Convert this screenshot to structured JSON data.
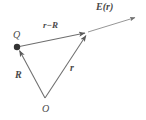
{
  "figure": {
    "width": 146,
    "height": 120,
    "background_color": "#ffffff",
    "stroke_color": "#6e6e6e",
    "text_color": "#4a4a4a"
  },
  "labels": {
    "field": "E(r)",
    "separation": "r−R",
    "charge": "Q",
    "source_vector": "R",
    "field_vector": "r",
    "origin": "O"
  },
  "points": {
    "origin": {
      "name": "O",
      "x": 45,
      "y": 98
    },
    "charge": {
      "name": "Q",
      "x": 17,
      "y": 47
    },
    "field_point": {
      "name": "P",
      "x": 88,
      "y": 32
    },
    "field_arrow_tip": {
      "name": "E-tip",
      "x": 137,
      "y": 17
    }
  },
  "vectors": [
    {
      "name": "R",
      "label": "R",
      "from": "origin",
      "to": "charge",
      "arrowhead": "at-tip"
    },
    {
      "name": "r",
      "label": "r",
      "from": "origin",
      "to": "field_point",
      "arrowhead": "at-tip"
    },
    {
      "name": "r-R",
      "label": "r−R",
      "from": "charge",
      "to": "field_point",
      "arrowhead": "at-tip"
    },
    {
      "name": "E",
      "label": "E(r)",
      "from": "field_point",
      "to": "field_arrow_tip",
      "arrowhead": "at-tip"
    }
  ],
  "markers": {
    "charge_dot": {
      "name": "point-charge-dot",
      "x": 17,
      "y": 47,
      "radius": 3.2,
      "fill": "#333333"
    }
  }
}
